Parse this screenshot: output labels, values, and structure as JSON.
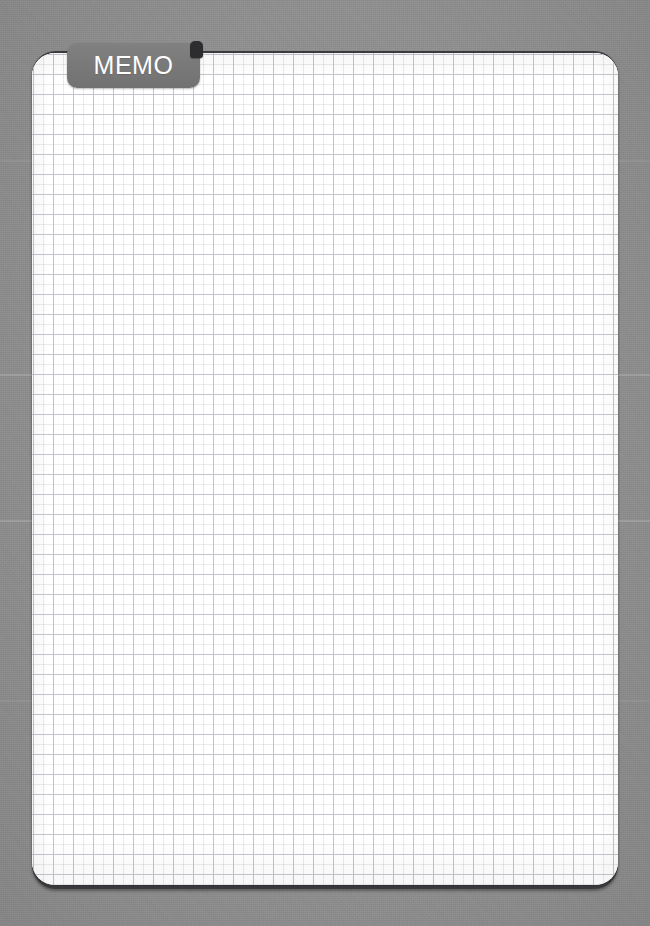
{
  "app": {
    "title": "MEMO",
    "kind": "grid-notepad"
  },
  "tab": {
    "label": "MEMO",
    "background_color": "#787878",
    "text_color": "#ffffff",
    "notch_color": "#2d2d2f"
  },
  "paper": {
    "background_color": "#ffffff",
    "edge_color": "#3b3b3d",
    "grid_line_color": "#b9c0c9",
    "grid_cell_px": 20,
    "corner_radius_px": 23
  },
  "note": {
    "content": "",
    "placeholder": ""
  },
  "backdrop": {
    "color": "#8f8f8f"
  }
}
